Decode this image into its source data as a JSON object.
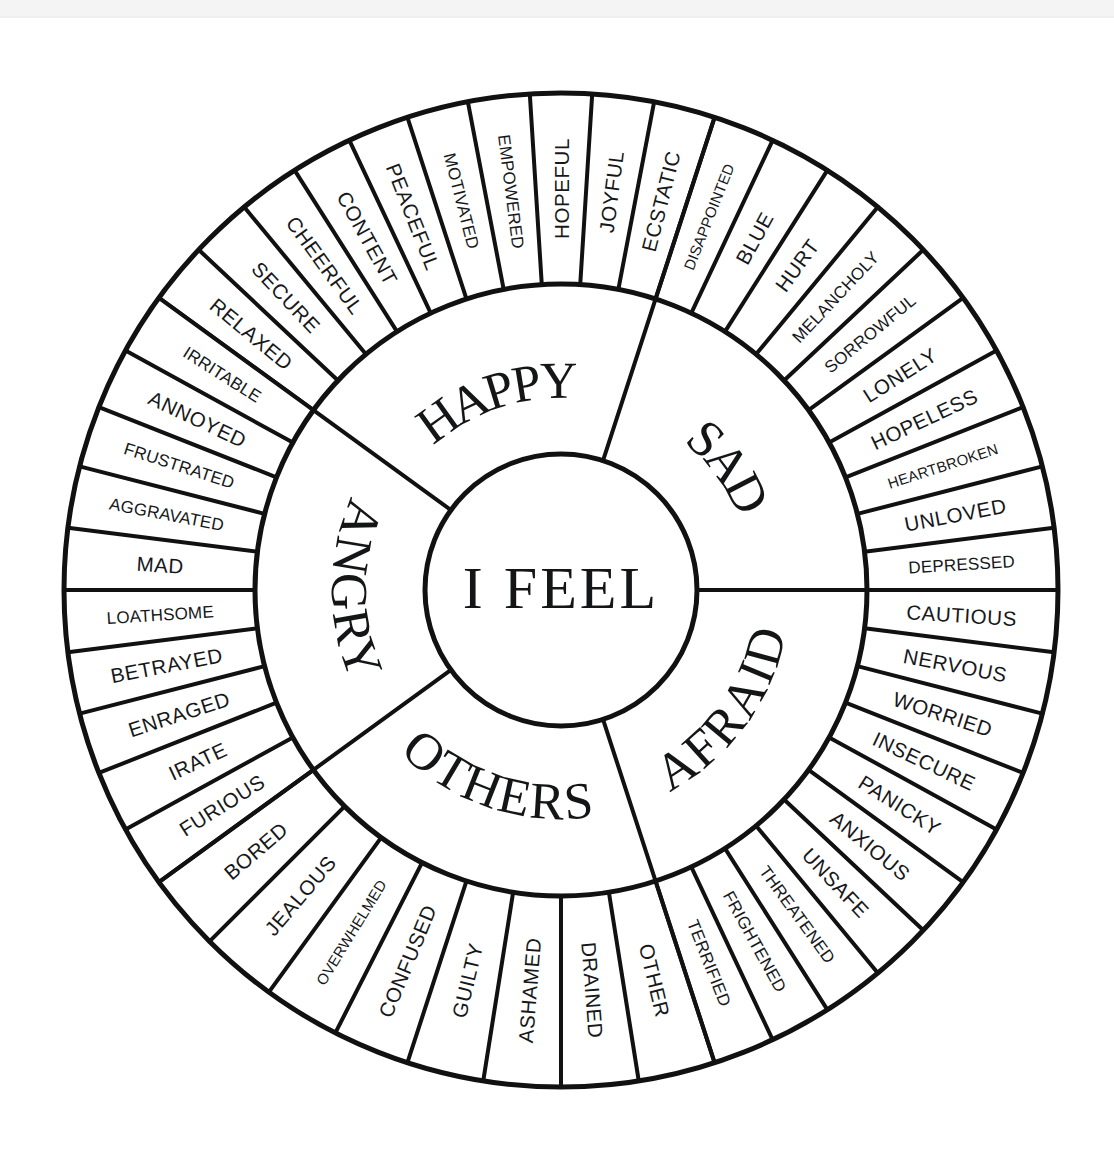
{
  "geometry": {
    "cx": 561,
    "cy": 590,
    "r_inner": 136,
    "r_mid": 306,
    "r_outer": 497
  },
  "center": {
    "label": "I FEEL"
  },
  "colors": {
    "stroke": "#111111",
    "face": "#ffffff",
    "text": "#17181a",
    "background": "#ffffff",
    "top_band": "#f4f4f4"
  },
  "categories": [
    {
      "name": "HAPPY",
      "start_deg": 216,
      "end_deg": 288,
      "emotions": [
        "RELAXED",
        "SECURE",
        "CHEERFUL",
        "CONTENT",
        "PEACEFUL",
        "MOTIVATED",
        "EMPOWERED",
        "HOPEFUL",
        "JOYFUL",
        "ECSTATIC"
      ]
    },
    {
      "name": "SAD",
      "start_deg": 288,
      "end_deg": 360,
      "emotions": [
        "DISAPPOINTED",
        "BLUE",
        "HURT",
        "MELANCHOLY",
        "SORROWFUL",
        "LONELY",
        "HOPELESS",
        "HEARTBROKEN",
        "UNLOVED",
        "DEPRESSED"
      ]
    },
    {
      "name": "AFRAID",
      "start_deg": 0,
      "end_deg": 72,
      "emotions": [
        "CAUTIOUS",
        "NERVOUS",
        "WORRIED",
        "INSECURE",
        "PANICKY",
        "ANXIOUS",
        "UNSAFE",
        "THREATENED",
        "FRIGHTENED",
        "TERRIFIED"
      ]
    },
    {
      "name": "OTHERS",
      "start_deg": 72,
      "end_deg": 144,
      "emotions": [
        "OTHER",
        "DRAINED",
        "ASHAMED",
        "GUILTY",
        "CONFUSED",
        "OVERWHELMED",
        "JEALOUS",
        "BORED"
      ]
    },
    {
      "name": "ANGRY",
      "start_deg": 144,
      "end_deg": 216,
      "emotions": [
        "FURIOUS",
        "IRATE",
        "ENRAGED",
        "BETRAYED",
        "LOATHSOME",
        "MAD",
        "AGGRAVATED",
        "FRUSTRATED",
        "ANNOYED",
        "IRRITABLE"
      ]
    }
  ]
}
